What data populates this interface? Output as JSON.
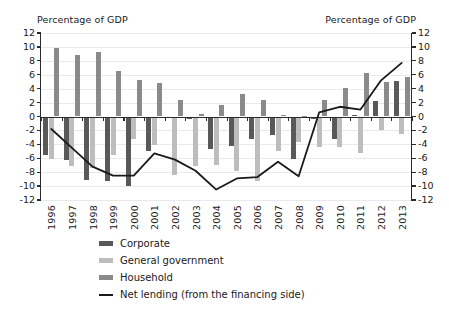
{
  "chart_data": {
    "type": "bar",
    "title": "",
    "left_axis_caption": "Percentage of GDP",
    "right_axis_caption": "Percentage of GDP",
    "xlabel": "",
    "ylabel": "Percentage of GDP",
    "ylim": [
      -12,
      12
    ],
    "yticks": [
      12,
      10,
      8,
      6,
      4,
      2,
      0,
      -2,
      -4,
      -6,
      -8,
      -10,
      -12
    ],
    "ytick_labels": [
      "12",
      "10",
      "8",
      "6",
      "4",
      "2",
      "0",
      "-2",
      "-4",
      "-6",
      "-8",
      "-10",
      "-12"
    ],
    "grid": true,
    "legend_position": "below",
    "categories": [
      "1996",
      "1997",
      "1998",
      "1999",
      "2000",
      "2001",
      "2002",
      "2003",
      "2004",
      "2005",
      "2006",
      "2007",
      "2008",
      "2009",
      "2010",
      "2011",
      "2012",
      "2013"
    ],
    "series": [
      {
        "name": "Corporate",
        "color": "#595959",
        "kind": "bar",
        "values": [
          -5.6,
          -6.3,
          -9.1,
          -9.2,
          -10.0,
          -4.9,
          -0.2,
          -0.3,
          -4.6,
          -4.3,
          -3.2,
          -2.7,
          -6.1,
          -0.3,
          -3.2,
          0.2,
          2.2,
          5.1
        ]
      },
      {
        "name": "General government",
        "color": "#bdbdbd",
        "kind": "bar",
        "values": [
          -6.1,
          -7.1,
          -7.4,
          -5.6,
          -3.2,
          -4.1,
          -8.4,
          -7.1,
          -6.9,
          -7.9,
          -9.3,
          -5.0,
          -3.6,
          -4.4,
          -4.4,
          -5.3,
          -2.0,
          -2.5
        ]
      },
      {
        "name": "Household",
        "color": "#8a8a8a",
        "kind": "bar",
        "values": [
          9.9,
          8.8,
          9.3,
          6.6,
          5.3,
          4.8,
          2.4,
          0.4,
          1.6,
          3.3,
          2.4,
          0.2,
          0.1,
          2.3,
          4.1,
          6.3,
          5.0,
          5.7
        ]
      },
      {
        "name": "Net lending (from the financing side)",
        "color": "#1a1a1a",
        "kind": "line",
        "values": [
          -1.8,
          -4.5,
          -7.2,
          -8.5,
          -8.5,
          -5.3,
          -6.2,
          -7.8,
          -10.5,
          -8.9,
          -8.7,
          -6.5,
          -8.6,
          0.6,
          1.4,
          1.0,
          5.2,
          7.7
        ]
      }
    ]
  },
  "legend": {
    "items": [
      {
        "label": "Corporate",
        "swatch": "corporate"
      },
      {
        "label": "General government",
        "swatch": "govt"
      },
      {
        "label": "Household",
        "swatch": "household"
      },
      {
        "label": "Net lending (from the financing side)",
        "swatch": "line"
      }
    ]
  }
}
